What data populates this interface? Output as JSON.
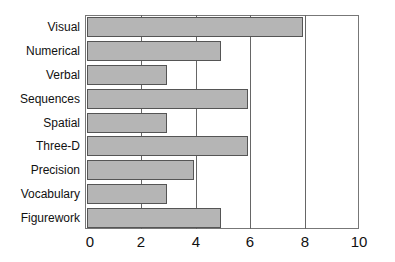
{
  "chart_data": {
    "type": "bar",
    "orientation": "horizontal",
    "title": "",
    "xlabel": "",
    "ylabel": "",
    "categories": [
      "Visual",
      "Numerical",
      "Verbal",
      "Sequences",
      "Spatial",
      "Three-D",
      "Precision",
      "Vocabulary",
      "Figurework"
    ],
    "values": [
      8,
      5,
      3,
      6,
      3,
      6,
      4,
      3,
      5
    ],
    "xlim": [
      0,
      10
    ],
    "xticks": [
      "0",
      "2",
      "4",
      "6",
      "8",
      "10"
    ],
    "grid": true,
    "legend": null,
    "colors": {
      "bar_fill": "#b5b5b5",
      "bar_edge": "#555555",
      "grid": "#666666"
    }
  }
}
